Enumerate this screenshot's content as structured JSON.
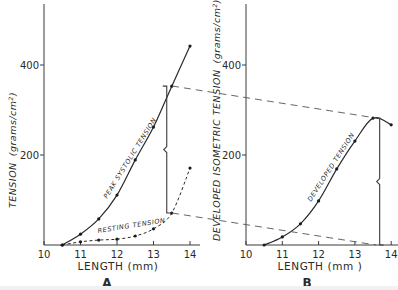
{
  "chart_data": [
    {
      "type": "line",
      "panel": "A",
      "title": "",
      "xlabel": "LENGTH (mm)",
      "ylabel": "TENSION (grams/cm²)",
      "xlim": [
        10,
        14
      ],
      "ylim": [
        0,
        520
      ],
      "xticks": [
        10,
        11,
        12,
        13,
        14
      ],
      "yticks": [
        200,
        400
      ],
      "grid": false,
      "legend": "none (inline curve labels)",
      "series": [
        {
          "name": "PEAK SYSTOLIC TENSION",
          "style": "solid",
          "x": [
            10.5,
            11,
            11.5,
            12,
            12.5,
            13,
            13.5,
            14
          ],
          "y": [
            0,
            24,
            58,
            111,
            189,
            262,
            353,
            442
          ]
        },
        {
          "name": "RESTING TENSION",
          "style": "dashed",
          "x": [
            10.5,
            11,
            11.5,
            12,
            12.5,
            13,
            13.5,
            14
          ],
          "y": [
            0,
            7,
            11,
            13,
            20,
            36,
            71,
            171
          ]
        }
      ],
      "annotations": [
        {
          "type": "bracket",
          "x": 13.5,
          "y_from": 71,
          "y_to": 353,
          "note": "developed tension at 13.5 mm"
        }
      ]
    },
    {
      "type": "line",
      "panel": "B",
      "title": "",
      "xlabel": "LENGTH (mm )",
      "ylabel": "DEVELOPED ISOMETRIC TENSION (grams/cm²)",
      "xlim": [
        10,
        14
      ],
      "ylim": [
        0,
        520
      ],
      "xticks": [
        10,
        11,
        12,
        13,
        14
      ],
      "yticks": [
        200,
        400
      ],
      "grid": false,
      "legend": "none (inline curve labels)",
      "series": [
        {
          "name": "DEVELOPED TENSION",
          "style": "solid",
          "x": [
            10.5,
            11,
            11.5,
            12,
            12.5,
            13,
            13.5,
            14
          ],
          "y": [
            0,
            18,
            47,
            98,
            169,
            231,
            282,
            267
          ]
        }
      ],
      "annotations": [
        {
          "type": "bracket",
          "x": 13.6,
          "y_from": 0,
          "y_to": 282,
          "note": "corresponds to bracket in A"
        },
        {
          "type": "guide-lines",
          "note": "dashed lines connect bracket ends in A to bracket ends in B"
        }
      ]
    }
  ],
  "labels": {
    "a": {
      "ylabel_main": "TENSION",
      "ylabel_units": "(grams/cm",
      "ylabel_sup": "2",
      "ylabel_close": ")",
      "xlabel": "LENGTH (mm)",
      "panel": "A",
      "ticks_x": [
        "10",
        "11",
        "12",
        "13",
        "14"
      ],
      "ticks_y": [
        "200",
        "400"
      ],
      "curve_peak": "PEAK SYSTOLIC TENSION",
      "curve_rest": "RESTING TENSION"
    },
    "b": {
      "ylabel_main": "DEVELOPED ISOMETRIC TENSION",
      "ylabel_units": "(grams/cm",
      "ylabel_sup": "2",
      "ylabel_close": ")",
      "xlabel": "LENGTH (mm )",
      "panel": "B",
      "ticks_x": [
        "10",
        "11",
        "12",
        "13",
        "14"
      ],
      "ticks_y": [
        "200",
        "400"
      ],
      "curve_dev": "DEVELOPED TENSION"
    }
  }
}
